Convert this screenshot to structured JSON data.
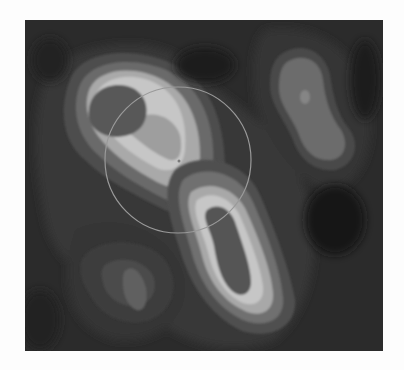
{
  "image": {
    "description": "Grayscale contour map with banded intensity levels and a thin circular overlay",
    "colors": {
      "background": "#2a2a2a",
      "level_1": "#363636",
      "level_2": "#4a4a4a",
      "level_3": "#626262",
      "level_4": "#7c7c7c",
      "level_5": "#a6a6a6",
      "level_6": "#c4c4c4",
      "core_dark": "#5a5a5a",
      "circle_stroke": "#9a9a9a"
    },
    "circle": {
      "cx": 153,
      "cy": 140,
      "r": 73
    },
    "center_marker": {
      "x": 154,
      "y": 141
    }
  }
}
